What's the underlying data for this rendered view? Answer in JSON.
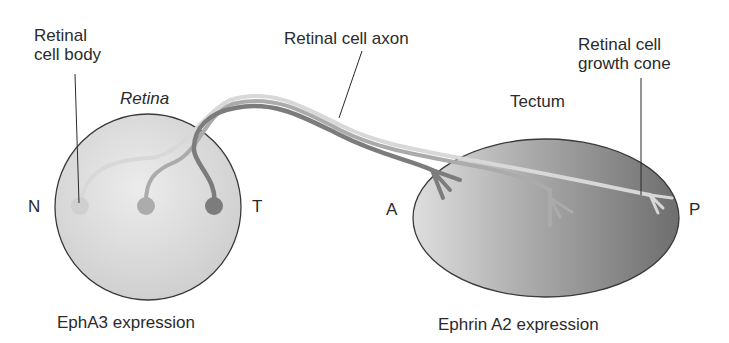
{
  "labels": {
    "retinal_cell_body": [
      "Retinal",
      "cell body"
    ],
    "retina": "Retina",
    "retinal_cell_axon": "Retinal cell axon",
    "retinal_cell_growth_cone": [
      "Retinal cell",
      "growth cone"
    ],
    "tectum": "Tectum",
    "retina_nasal": "N",
    "retina_temporal": "T",
    "tectum_anterior": "A",
    "tectum_posterior": "P",
    "retina_caption": "EphA3 expression",
    "tectum_caption": "Ephrin A2 expression"
  },
  "colors": {
    "retina_fill_light": "#e6e6e6",
    "retina_fill_dark": "#cfcfcf",
    "tectum_fill_light": "#cfcfcf",
    "tectum_fill_dark": "#7f7f7f",
    "outline": "#3a3a3a",
    "axon_light": "#d6d6d6",
    "axon_medium": "#acacac",
    "axon_dark": "#7a7a7a"
  },
  "cells": [
    {
      "position": "nasal",
      "shade": "light"
    },
    {
      "position": "middle",
      "shade": "medium"
    },
    {
      "position": "temporal",
      "shade": "dark"
    }
  ]
}
